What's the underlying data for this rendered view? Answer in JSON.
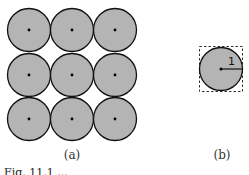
{
  "diagram": {
    "panel_a": {
      "label": "(a)",
      "grid_rows": 3,
      "grid_cols": 3,
      "circle_fill": "#b4b4b4",
      "circle_stroke": "#111111"
    },
    "panel_b": {
      "label": "(b)",
      "radius_label": "1",
      "circle_fill": "#b4b4b4",
      "box_style": "dashed"
    },
    "caption": "Fig. 11.1 ..."
  }
}
